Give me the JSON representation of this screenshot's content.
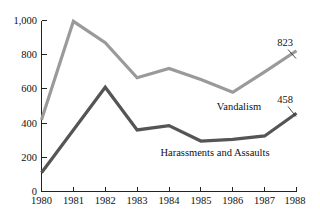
{
  "chart_data": {
    "type": "line",
    "title": "",
    "xlabel": "",
    "ylabel": "",
    "categories": [
      "1980",
      "1981",
      "1982",
      "1983",
      "1984",
      "1985",
      "1986",
      "1987",
      "1988"
    ],
    "x": [
      1980,
      1981,
      1982,
      1983,
      1984,
      1985,
      1986,
      1987,
      1988
    ],
    "ylim": [
      0,
      1000
    ],
    "xlim": [
      1980,
      1988
    ],
    "grid": false,
    "legend_position": "inline-annotation",
    "y_ticks": [
      0,
      200,
      400,
      600,
      800,
      1000
    ],
    "y_tick_labels": [
      "0",
      "200",
      "400",
      "600",
      "800",
      "1,000"
    ],
    "series": [
      {
        "name": "Vandalism",
        "color": "#9a9a9a",
        "values": [
          420,
          995,
          870,
          665,
          720,
          655,
          580,
          700,
          823
        ],
        "end_value_label": "823"
      },
      {
        "name": "Harassments and Assaults",
        "color": "#555555",
        "values": [
          110,
          360,
          610,
          360,
          385,
          295,
          305,
          325,
          458
        ],
        "end_value_label": "458"
      }
    ],
    "annotations": [
      {
        "text": "Vandalism",
        "kind": "series-inline-label"
      },
      {
        "text": "Harassments and Assaults",
        "kind": "series-inline-label"
      },
      {
        "text": "823",
        "kind": "endpoint-value"
      },
      {
        "text": "458",
        "kind": "endpoint-value"
      }
    ]
  },
  "axes": {
    "y_tick_labels": [
      "1,000",
      "800",
      "600",
      "400",
      "200",
      "0"
    ],
    "x_tick_labels": [
      "1980",
      "1981",
      "1982",
      "1983",
      "1984",
      "1985",
      "1986",
      "1987",
      "1988"
    ]
  },
  "labels": {
    "vandalism": "Vandalism",
    "harassments": "Harassments and Assaults",
    "vandalism_value": "823",
    "harassments_value": "458"
  },
  "colors": {
    "vandalism_line": "#9a9a9a",
    "harassments_line": "#555555",
    "axis": "#222222",
    "background": "#ffffff",
    "text": "#111111"
  }
}
